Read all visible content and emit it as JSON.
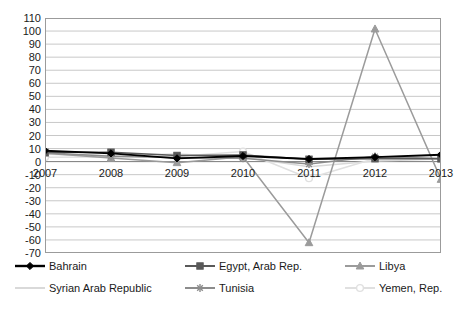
{
  "chart_data": {
    "type": "line",
    "title": "",
    "subtitle": "",
    "xlabel": "",
    "ylabel": "",
    "x": [
      2007,
      2008,
      2009,
      2010,
      2011,
      2012,
      2013
    ],
    "categories": [
      "2007",
      "2008",
      "2009",
      "2010",
      "2011",
      "2012",
      "2013"
    ],
    "xlim": [
      2007,
      2013
    ],
    "ylim": [
      -70,
      110
    ],
    "y_ticks": [
      110,
      100,
      90,
      80,
      70,
      60,
      50,
      40,
      30,
      20,
      10,
      0,
      -10,
      -20,
      -30,
      -40,
      -50,
      -60,
      -70
    ],
    "y_tick_labels": [
      "110",
      "100",
      "90",
      "80",
      "70",
      "60",
      "50",
      "40",
      "30",
      "20",
      "10",
      "0",
      "-10",
      "-20",
      "-30",
      "-40",
      "-50",
      "-60",
      "-70"
    ],
    "grid": true,
    "grid_axis": "y",
    "legend_position": "bottom",
    "legend_columns": 3,
    "series": [
      {
        "name": "Bahrain",
        "color": "#000000",
        "marker": "diamond",
        "values": [
          8.3,
          6.3,
          2.5,
          4.3,
          2.0,
          3.4,
          5.3
        ]
      },
      {
        "name": "Egypt, Arab Rep.",
        "color": "#595959",
        "marker": "square",
        "values": [
          7.1,
          7.2,
          4.7,
          5.1,
          1.8,
          2.2,
          2.1
        ]
      },
      {
        "name": "Libya",
        "color": "#9b9b9b",
        "marker": "triangle",
        "values": [
          6.4,
          2.7,
          -0.8,
          3.7,
          -62.1,
          101.6,
          -13.6
        ]
      },
      {
        "name": "Syrian Arab Republic",
        "color": "#d9d9d9",
        "marker": "none",
        "values": [
          5.7,
          4.5,
          5.9,
          3.4,
          -3.9,
          0.5,
          2.0
        ]
      },
      {
        "name": "Tunisia",
        "color": "#8c8c8c",
        "marker": "asterisk",
        "values": [
          6.7,
          4.2,
          3.1,
          2.6,
          -1.9,
          3.9,
          2.4
        ]
      },
      {
        "name": "Yemen, Rep.",
        "color": "#e0e0e0",
        "marker": "circle",
        "values": [
          3.3,
          3.6,
          3.9,
          7.7,
          -12.7,
          2.4,
          4.8
        ]
      }
    ]
  },
  "legend": {
    "items": [
      {
        "label": "Bahrain"
      },
      {
        "label": "Egypt, Arab Rep."
      },
      {
        "label": "Libya"
      },
      {
        "label": "Syrian Arab Republic"
      },
      {
        "label": "Tunisia"
      },
      {
        "label": "Yemen, Rep."
      }
    ]
  }
}
